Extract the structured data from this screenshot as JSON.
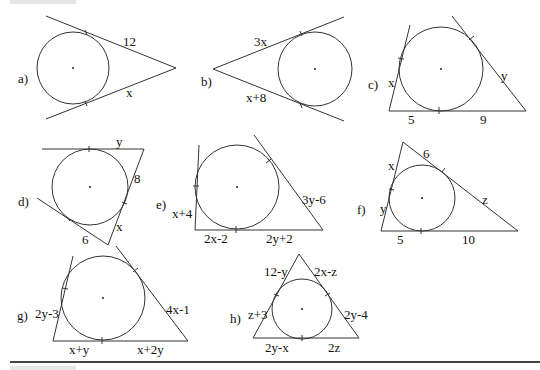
{
  "figures": [
    {
      "id": "a",
      "label": "a)",
      "type": "two-tangents-from-external-point",
      "segments": [
        "12",
        "x"
      ]
    },
    {
      "id": "b",
      "label": "b)",
      "type": "two-tangents-from-external-point",
      "segments": [
        "3x",
        "x+8"
      ]
    },
    {
      "id": "c",
      "label": "c)",
      "type": "circle-inscribed-in-angle-triangle",
      "segments": [
        "x",
        "y",
        "5",
        "9"
      ]
    },
    {
      "id": "d",
      "label": "d)",
      "type": "circle-inscribed-in-angle-triangle",
      "segments": [
        "y",
        "8",
        "x",
        "6"
      ]
    },
    {
      "id": "e",
      "label": "e)",
      "type": "circle-inscribed-in-angle-triangle",
      "segments": [
        "x+4",
        "3y-6",
        "2x-2",
        "2y+2"
      ]
    },
    {
      "id": "f",
      "label": "f)",
      "type": "inscribed-circle-triangle",
      "segments": [
        "x",
        "6",
        "y",
        "z",
        "5",
        "10"
      ]
    },
    {
      "id": "g",
      "label": "g)",
      "type": "circle-inscribed-in-angle-triangle",
      "segments": [
        "2y-3",
        "4x-1",
        "x+y",
        "x+2y"
      ]
    },
    {
      "id": "h",
      "label": "h)",
      "type": "inscribed-circle-triangle",
      "segments": [
        "12-y",
        "2x-z",
        "z+3",
        "2y-4",
        "2y-x",
        "2z"
      ]
    }
  ]
}
